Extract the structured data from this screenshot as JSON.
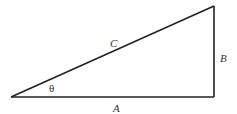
{
  "diagram": {
    "type": "right-triangle",
    "stroke_color": "#222222",
    "vertices": {
      "left": [
        11,
        97
      ],
      "bottom_right": [
        214,
        97
      ],
      "top_right": [
        214,
        6
      ]
    },
    "labels": {
      "hypotenuse": "C",
      "opposite": "B",
      "adjacent": "A",
      "angle": "θ"
    }
  }
}
